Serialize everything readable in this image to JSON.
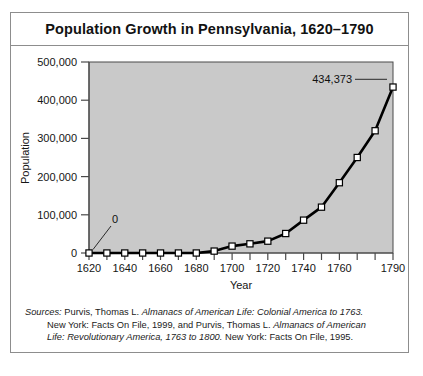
{
  "figure": {
    "title": "Population Growth in Pennsylvania, 1620–1790",
    "border_color": "#8d8d8d",
    "plot_bg": "#c9c9c9"
  },
  "source_note": {
    "label": "Sources:",
    "line1_rest": " Purvis, Thomas L. ",
    "line1_italic": "Almanacs of American Life: Colonial America to 1763.",
    "line2_a": "New York: Facts On File, 1999, and Purvis, Thomas L. ",
    "line2_italic": "Almanacs of American",
    "line3_italic": "Life: Revolutionary America, 1763 to 1800.",
    "line3_rest": " New York: Facts On File, 1995."
  },
  "chart_data": {
    "type": "line",
    "title": "Population Growth in Pennsylvania, 1620–1790",
    "xlabel": "Year",
    "ylabel": "Population",
    "xlim": [
      1620,
      1790
    ],
    "ylim": [
      0,
      500000
    ],
    "ytick_labels": [
      "0",
      "100,000",
      "200,000",
      "300,000",
      "400,000",
      "500,000"
    ],
    "ytick_values": [
      0,
      100000,
      200000,
      300000,
      400000,
      500000
    ],
    "xtick_labels": [
      "1620",
      "1640",
      "1660",
      "1680",
      "1700",
      "1720",
      "1740",
      "1760",
      "1790"
    ],
    "xtick_values": [
      1620,
      1640,
      1660,
      1680,
      1700,
      1720,
      1740,
      1760,
      1790
    ],
    "xtick_minor": [
      1630,
      1650,
      1670,
      1690,
      1710,
      1730,
      1750,
      1770,
      1780
    ],
    "grid": false,
    "legend": false,
    "marker": "square-open",
    "line_color": "#000000",
    "x": [
      1620,
      1630,
      1640,
      1650,
      1660,
      1670,
      1680,
      1690,
      1700,
      1710,
      1720,
      1730,
      1740,
      1750,
      1760,
      1770,
      1780,
      1790
    ],
    "values": [
      0,
      0,
      0,
      0,
      0,
      0,
      0,
      5000,
      18000,
      24000,
      31000,
      51000,
      86000,
      120000,
      184000,
      250000,
      320000,
      434373
    ],
    "annotations": [
      {
        "text": "0",
        "x": 1620,
        "y": 0,
        "placement": "above-right-leader"
      },
      {
        "text": "434,373",
        "x": 1790,
        "y": 434373,
        "placement": "left-leader"
      }
    ]
  }
}
